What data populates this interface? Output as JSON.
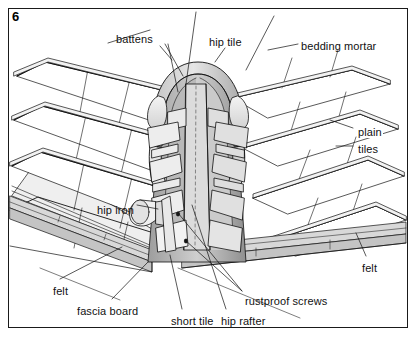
{
  "figure": {
    "number": "6",
    "border_color": "#1a1a1a",
    "background": "#ffffff",
    "line_color": "#111111",
    "shade_light": "#e8e8e8",
    "shade_mid": "#c9c9c9",
    "shade_dark": "#9e9e9e"
  },
  "labels": [
    {
      "id": "battens",
      "text": "battens",
      "x": 116,
      "y": 33
    },
    {
      "id": "hip-tile",
      "text": "hip tile",
      "x": 209,
      "y": 36
    },
    {
      "id": "bedding-mortar",
      "text": "bedding mortar",
      "x": 301,
      "y": 40
    },
    {
      "id": "plain-tiles",
      "text": "plain",
      "x": 357,
      "y": 126
    },
    {
      "id": "plain-tiles-2",
      "text": "tiles",
      "x": 357,
      "y": 143
    },
    {
      "id": "hip-iron",
      "text": "hip iron",
      "x": 97,
      "y": 204
    },
    {
      "id": "felt-left",
      "text": "felt",
      "x": 53,
      "y": 285
    },
    {
      "id": "fascia-board",
      "text": "fascia board",
      "x": 77,
      "y": 305
    },
    {
      "id": "short-tile",
      "text": "short tile",
      "x": 171,
      "y": 315
    },
    {
      "id": "hip-rafter",
      "text": "hip rafter",
      "x": 221,
      "y": 315
    },
    {
      "id": "rustproof-screws",
      "text": "rustproof screws",
      "x": 245,
      "y": 295
    },
    {
      "id": "felt-right",
      "text": "felt",
      "x": 362,
      "y": 262
    }
  ],
  "leaders": [
    {
      "id": "battens-1",
      "points": "108,43 150,30"
    },
    {
      "id": "battens-2",
      "points": "160,46 172,60"
    },
    {
      "id": "battens-3",
      "points": "165,44 183,76"
    },
    {
      "id": "battens-4",
      "points": "168,44 178,92"
    },
    {
      "id": "hip-tile-leader",
      "points": "225,48 215,62"
    },
    {
      "id": "bedding-mortar-leader",
      "points": "298,44 268,50"
    },
    {
      "id": "plain-tiles-leader-1",
      "points": "353,128 330,120"
    },
    {
      "id": "plain-tiles-leader-2",
      "points": "353,146 336,146"
    },
    {
      "id": "hip-iron-leader",
      "points": "137,205 158,209"
    },
    {
      "id": "felt-left-leader",
      "points": "60,279 122,247"
    },
    {
      "id": "fascia-board-leader",
      "points": "112,299 148,262"
    },
    {
      "id": "short-tile-leader",
      "points": "182,309 170,255"
    },
    {
      "id": "hip-rafter-leader",
      "points": "226,309 192,205"
    },
    {
      "id": "rustproof-leader-1",
      "points": "242,291 178,213"
    },
    {
      "id": "rustproof-leader-2",
      "points": "242,291 185,240"
    },
    {
      "id": "felt-right-leader",
      "points": "366,256 356,233"
    }
  ]
}
